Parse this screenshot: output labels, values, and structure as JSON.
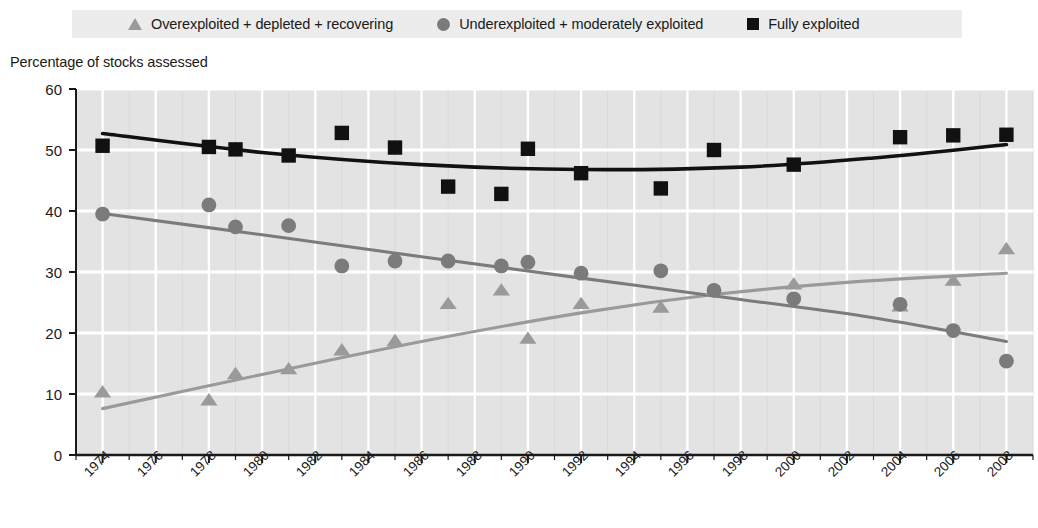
{
  "legend": {
    "items": [
      {
        "marker": "triangle-marker",
        "label": "Overexploited + depleted + recovering",
        "color": "#9a9a9a"
      },
      {
        "marker": "circle-marker",
        "label": "Underexploited + moderately exploited",
        "color": "#7b7b7b"
      },
      {
        "marker": "square-marker",
        "label": "Fully exploited",
        "color": "#111111"
      }
    ],
    "background": "#ececec"
  },
  "axis_title": "Percentage of stocks assessed",
  "chart_data": {
    "type": "scatter",
    "title": "",
    "subtitle": "",
    "xlabel": "",
    "ylabel": "Percentage of stocks assessed",
    "xlim": [
      1973,
      2009
    ],
    "ylim": [
      0,
      60
    ],
    "yticks": [
      0,
      10,
      20,
      30,
      40,
      50,
      60
    ],
    "xticks": [
      1974,
      1976,
      1978,
      1980,
      1982,
      1984,
      1986,
      1988,
      1990,
      1992,
      1994,
      1996,
      1998,
      2000,
      2002,
      2004,
      2006,
      2008
    ],
    "grid": true,
    "grid_color": "#ffffff",
    "plot_background": "#e3e3e3",
    "legend_position": "top",
    "series": [
      {
        "name": "Overexploited + depleted + recovering",
        "marker": "triangle",
        "color": "#9a9a9a",
        "points": [
          {
            "x": 1974,
            "y": 10.2
          },
          {
            "x": 1978,
            "y": 8.9
          },
          {
            "x": 1979,
            "y": 13.2
          },
          {
            "x": 1981,
            "y": 14.0
          },
          {
            "x": 1983,
            "y": 17.1
          },
          {
            "x": 1985,
            "y": 18.6
          },
          {
            "x": 1987,
            "y": 24.7
          },
          {
            "x": 1989,
            "y": 26.9
          },
          {
            "x": 1990,
            "y": 19.0
          },
          {
            "x": 1992,
            "y": 24.7
          },
          {
            "x": 1995,
            "y": 24.1
          },
          {
            "x": 1997,
            "y": 27.0
          },
          {
            "x": 2000,
            "y": 27.9
          },
          {
            "x": 2004,
            "y": 24.3
          },
          {
            "x": 2006,
            "y": 28.5
          },
          {
            "x": 2008,
            "y": 33.7
          }
        ],
        "trend": [
          {
            "x": 1974,
            "y": 7.6
          },
          {
            "x": 1980,
            "y": 13.2
          },
          {
            "x": 1986,
            "y": 18.6
          },
          {
            "x": 1992,
            "y": 23.3
          },
          {
            "x": 1997,
            "y": 26.3
          },
          {
            "x": 2002,
            "y": 28.3
          },
          {
            "x": 2008,
            "y": 29.8
          }
        ]
      },
      {
        "name": "Underexploited + moderately exploited",
        "marker": "circle",
        "color": "#7b7b7b",
        "points": [
          {
            "x": 1974,
            "y": 39.5
          },
          {
            "x": 1978,
            "y": 41.0
          },
          {
            "x": 1979,
            "y": 37.4
          },
          {
            "x": 1981,
            "y": 37.6
          },
          {
            "x": 1983,
            "y": 31.0
          },
          {
            "x": 1985,
            "y": 31.8
          },
          {
            "x": 1987,
            "y": 31.8
          },
          {
            "x": 1989,
            "y": 31.0
          },
          {
            "x": 1990,
            "y": 31.6
          },
          {
            "x": 1992,
            "y": 29.8
          },
          {
            "x": 1995,
            "y": 30.2
          },
          {
            "x": 1997,
            "y": 27.0
          },
          {
            "x": 2000,
            "y": 25.6
          },
          {
            "x": 2004,
            "y": 24.7
          },
          {
            "x": 2006,
            "y": 20.4
          },
          {
            "x": 2008,
            "y": 15.4
          }
        ],
        "trend": [
          {
            "x": 1974,
            "y": 39.6
          },
          {
            "x": 1980,
            "y": 36.1
          },
          {
            "x": 1986,
            "y": 32.5
          },
          {
            "x": 1992,
            "y": 29.0
          },
          {
            "x": 1998,
            "y": 25.5
          },
          {
            "x": 2003,
            "y": 22.5
          },
          {
            "x": 2008,
            "y": 18.6
          }
        ]
      },
      {
        "name": "Fully exploited",
        "marker": "square",
        "color": "#111111",
        "points": [
          {
            "x": 1974,
            "y": 50.7
          },
          {
            "x": 1978,
            "y": 50.5
          },
          {
            "x": 1979,
            "y": 50.1
          },
          {
            "x": 1981,
            "y": 49.1
          },
          {
            "x": 1983,
            "y": 52.8
          },
          {
            "x": 1985,
            "y": 50.4
          },
          {
            "x": 1987,
            "y": 44.0
          },
          {
            "x": 1989,
            "y": 42.8
          },
          {
            "x": 1990,
            "y": 50.2
          },
          {
            "x": 1992,
            "y": 46.2
          },
          {
            "x": 1995,
            "y": 43.7
          },
          {
            "x": 1997,
            "y": 50.0
          },
          {
            "x": 2000,
            "y": 47.6
          },
          {
            "x": 2004,
            "y": 52.1
          },
          {
            "x": 2006,
            "y": 52.4
          },
          {
            "x": 2008,
            "y": 52.5
          }
        ],
        "trend": [
          {
            "x": 1974,
            "y": 52.7
          },
          {
            "x": 1980,
            "y": 49.6
          },
          {
            "x": 1986,
            "y": 47.6
          },
          {
            "x": 1992,
            "y": 46.8
          },
          {
            "x": 1998,
            "y": 47.2
          },
          {
            "x": 2003,
            "y": 48.7
          },
          {
            "x": 2008,
            "y": 50.9
          }
        ]
      }
    ]
  }
}
